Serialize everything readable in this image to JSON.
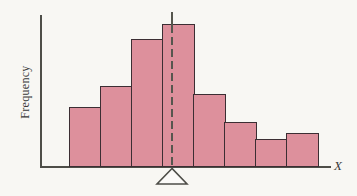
{
  "chart_data": {
    "type": "bar",
    "subtype": "histogram",
    "title": "",
    "ylabel": "Frequency",
    "xlabel": "X",
    "categories": [
      "bin-1",
      "bin-2",
      "bin-3",
      "bin-4",
      "bin-5",
      "bin-6",
      "bin-7",
      "bin-8"
    ],
    "values": [
      60,
      81,
      128,
      143,
      73,
      45,
      28,
      34
    ],
    "ylim": [
      0,
      143
    ],
    "grid": false,
    "legend": "none",
    "annotations": {
      "mean_line": "vertical line, solid above tallest bar then dashed through it down to the x-axis",
      "fulcrum": "white balance-point triangle centered under the mean line below the x-axis"
    }
  },
  "colors": {
    "background": "#f8f7f3",
    "bar_fill": "#dd909c",
    "bar_border": "#3c2e33",
    "axis": "#4e4e48",
    "mean_line": "#56564e",
    "fulcrum_fill": "#fbfaf8",
    "text": "#3a3a3a"
  }
}
